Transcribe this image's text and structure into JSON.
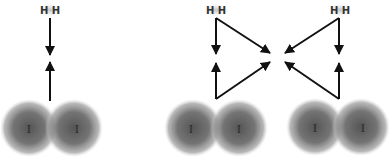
{
  "diagram": {
    "type": "reaction-mechanism",
    "panels": [
      {
        "id": "left",
        "h2_label": "H H",
        "i2_labels": [
          "I",
          "I"
        ],
        "description": "Simple approach: H2 and I2 move toward each other along one axis"
      },
      {
        "id": "middle",
        "h2_label": "H H",
        "i2_labels": [
          "I",
          "I"
        ],
        "description": "Triangular pathway: H2 and I2 arrows converge toward a common point on the right"
      },
      {
        "id": "right",
        "h2_label": "H H",
        "i2_labels": [
          "I",
          "I"
        ],
        "description": "Mirrored triangular pathway: arrows converge toward a common point on the left"
      }
    ],
    "colors": {
      "arrow": "#111111",
      "atom_cloud": "#6b6b6b",
      "text": "#2a2a2a"
    }
  }
}
